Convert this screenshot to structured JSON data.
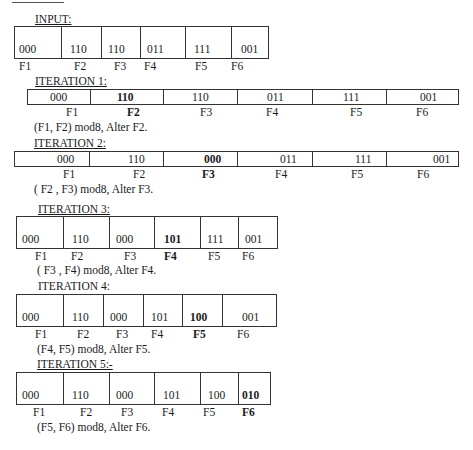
{
  "input": {
    "heading": "INPUT:",
    "cells": [
      {
        "value": "000",
        "label": "F1"
      },
      {
        "value": "110",
        "label": "F2"
      },
      {
        "value": "110",
        "label": "F3"
      },
      {
        "value": "011",
        "label": "F4"
      },
      {
        "value": "111",
        "label": "F5"
      },
      {
        "value": "001",
        "label": "F6"
      }
    ]
  },
  "iterations": [
    {
      "heading": "ITERATION 1:",
      "cells": [
        {
          "value": "000",
          "label": "F1"
        },
        {
          "value": "110",
          "label": "F2",
          "highlight": true
        },
        {
          "value": "110",
          "label": "F3"
        },
        {
          "value": "011",
          "label": "F4"
        },
        {
          "value": "111",
          "label": "F5"
        },
        {
          "value": "001",
          "label": "F6"
        }
      ],
      "note": "(F1, F2) mod8,  Alter F2."
    },
    {
      "heading": "ITERATION 2:",
      "cells": [
        {
          "value": "000",
          "label": "F1"
        },
        {
          "value": "110",
          "label": "F2"
        },
        {
          "value": "000",
          "label": "F3",
          "highlight": true
        },
        {
          "value": "011",
          "label": "F4"
        },
        {
          "value": "111",
          "label": "F5"
        },
        {
          "value": "001",
          "label": "F6"
        }
      ],
      "note": "( F2 , F3) mod8, Alter F3."
    },
    {
      "heading": "ITERATION 3:",
      "cells": [
        {
          "value": "000",
          "label": "F1"
        },
        {
          "value": "110",
          "label": "F2"
        },
        {
          "value": "000",
          "label": "F3"
        },
        {
          "value": "101",
          "label": "F4",
          "highlight": true
        },
        {
          "value": "111",
          "label": "F5"
        },
        {
          "value": "001",
          "label": "F6"
        }
      ],
      "note": "( F3 , F4) mod8, Alter F4."
    },
    {
      "heading": "ITERATION 4:",
      "cells": [
        {
          "value": "000",
          "label": "F1"
        },
        {
          "value": "110",
          "label": "F2"
        },
        {
          "value": "000",
          "label": "F3"
        },
        {
          "value": "101",
          "label": "F4"
        },
        {
          "value": "100",
          "label": "F5",
          "highlight": true
        },
        {
          "value": "001",
          "label": "F6"
        }
      ],
      "note": "(F4, F5) mod8, Alter F5."
    },
    {
      "heading": "ITERATION 5:-",
      "cells": [
        {
          "value": "000",
          "label": "F1"
        },
        {
          "value": "110",
          "label": "F2"
        },
        {
          "value": "000",
          "label": "F3"
        },
        {
          "value": "101",
          "label": "F4"
        },
        {
          "value": "100",
          "label": "F5"
        },
        {
          "value": "010",
          "label": "F6",
          "highlight": true
        }
      ],
      "note": "(F5, F6) mod8, Alter F6."
    }
  ]
}
